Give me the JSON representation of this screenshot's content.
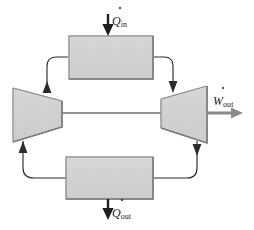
{
  "figure": {
    "name": "brayton-cycle-schematic",
    "title": "",
    "background_color": "#ffffff"
  },
  "colors": {
    "component_fill": "#d2d2d2",
    "component_fill_light": "#dcdcdc",
    "component_stroke": "#8f8f8f",
    "line": "#2b2b2b",
    "work_arrow": "#8a8a8a",
    "text": "#1a1a1a"
  },
  "components": [
    {
      "id": "heat-addition-exchanger",
      "type": "rectangle",
      "label": "",
      "position": "top"
    },
    {
      "id": "compressor",
      "type": "trapezoid-narrowing-right",
      "label": "",
      "position": "left"
    },
    {
      "id": "turbine",
      "type": "trapezoid-widening-right",
      "label": "",
      "position": "right"
    },
    {
      "id": "heat-rejection-exchanger",
      "type": "rectangle",
      "label": "",
      "position": "bottom"
    }
  ],
  "flow_arrows": [
    {
      "id": "compressor-to-heater",
      "direction": "up",
      "position": "upper-left"
    },
    {
      "id": "heater-to-turbine",
      "direction": "down",
      "position": "upper-right"
    },
    {
      "id": "turbine-to-cooler",
      "direction": "down",
      "position": "lower-right"
    },
    {
      "id": "cooler-to-compressor",
      "direction": "up",
      "position": "lower-left"
    }
  ],
  "labels": {
    "heat_in": {
      "symbol": "Q",
      "dot": "·",
      "subscript": "in",
      "text": "Q̇in",
      "arrow_direction": "down"
    },
    "heat_out": {
      "symbol": "Q",
      "dot": "·",
      "subscript": "out",
      "text": "Q̇out",
      "arrow_direction": "down"
    },
    "work_out": {
      "symbol": "W",
      "dot": "·",
      "subscript": "out",
      "text": "Ẇout",
      "arrow_direction": "right"
    }
  }
}
